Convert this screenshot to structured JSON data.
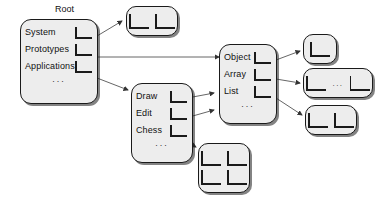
{
  "diagram": {
    "title_label": "Root",
    "ellipsis": "...",
    "dots": "...",
    "colors": {
      "node_fill": "#ededed",
      "stroke": "#1a1a1a",
      "wire": "#555555",
      "background": "#ffffff"
    },
    "root_node": {
      "caption": "Root",
      "rows": [
        {
          "label": "System",
          "slot": "l-slot-icon"
        },
        {
          "label": "Prototypes",
          "slot": "l-slot-icon"
        },
        {
          "label": "Applications",
          "slot": "l-slot-icon"
        }
      ],
      "more": "..."
    },
    "applications_node": {
      "rows": [
        {
          "label": "Draw",
          "slot": "l-slot-icon"
        },
        {
          "label": "Edit",
          "slot": "l-slot-icon"
        },
        {
          "label": "Chess",
          "slot": "l-slot-icon"
        }
      ],
      "more": "..."
    },
    "prototypes_node": {
      "rows": [
        {
          "label": "Object",
          "slot": "l-slot-icon"
        },
        {
          "label": "Array",
          "slot": "l-slot-icon"
        },
        {
          "label": "List",
          "slot": "l-slot-icon"
        }
      ],
      "more": "..."
    },
    "anonymous_nodes": [
      {
        "name": "system-target-node",
        "cells": 2,
        "separator": ""
      },
      {
        "name": "object-target-node",
        "cells": 1,
        "separator": ""
      },
      {
        "name": "array-target-node",
        "cells": 2,
        "separator": "..."
      },
      {
        "name": "list-target-node",
        "cells": 2,
        "separator": ""
      },
      {
        "name": "chess-target-node",
        "cells": 4,
        "separator": ""
      }
    ],
    "edges": [
      {
        "from": "root.System",
        "to": "system-target-node"
      },
      {
        "from": "root.Prototypes",
        "to": "prototypes-node"
      },
      {
        "from": "root.Applications",
        "to": "applications-node"
      },
      {
        "from": "applications.Draw",
        "to": "prototypes-node"
      },
      {
        "from": "applications.Edit",
        "to": "prototypes-node"
      },
      {
        "from": "applications.Chess",
        "to": "chess-target-node"
      },
      {
        "from": "prototypes.Object",
        "to": "object-target-node"
      },
      {
        "from": "prototypes.Array",
        "to": "array-target-node"
      },
      {
        "from": "prototypes.List",
        "to": "list-target-node"
      }
    ]
  }
}
